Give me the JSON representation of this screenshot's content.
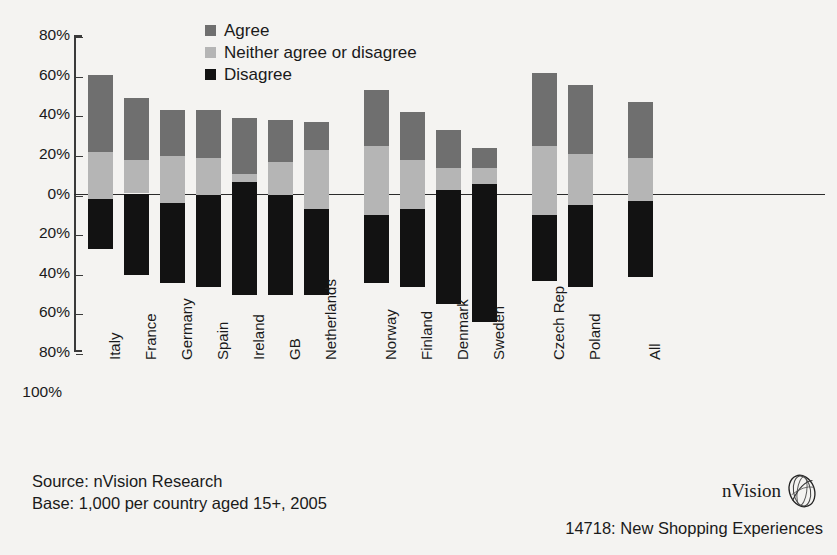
{
  "chart_data": {
    "type": "bar",
    "subtype": "diverging-stacked",
    "title": "",
    "xlabel": "",
    "ylabel": "",
    "ylim": [
      -100,
      80
    ],
    "grid": false,
    "legend_position": "top-center",
    "legend": [
      "Agree",
      "Neither agree or disagree",
      "Disagree"
    ],
    "colors": {
      "agree": "#6f6f6f",
      "neither": "#b5b5b5",
      "disagree": "#121212",
      "zero_line": "#2b2b2b",
      "background": "#f4f3f1"
    },
    "ytick_labels": [
      "80%",
      "60%",
      "40%",
      "20%",
      "0%",
      "20%",
      "40%",
      "60%",
      "80%",
      "100%"
    ],
    "ytick_values": [
      80,
      60,
      40,
      20,
      0,
      -20,
      -40,
      -60,
      -80,
      -100
    ],
    "categories": [
      "Italy",
      "France",
      "Germany",
      "Spain",
      "Ireland",
      "GB",
      "Netherlands",
      "Norway",
      "Finland",
      "Denmark",
      "Sweden",
      "Czech Rep",
      "Poland",
      "All"
    ],
    "series": [
      {
        "name": "Agree",
        "values": [
          60,
          48,
          42,
          42,
          38,
          37,
          36,
          52,
          41,
          32,
          23,
          61,
          55,
          46
        ]
      },
      {
        "name": "Neither agree or disagree",
        "values": [
          21,
          17,
          19,
          18,
          10,
          16,
          22,
          24,
          17,
          13,
          13,
          24,
          20,
          18
        ]
      },
      {
        "name": "Disagree",
        "values": [
          -28,
          -41,
          -45,
          -47,
          -51,
          -51,
          -51,
          -45,
          -47,
          -56,
          -65,
          -44,
          -47,
          -42
        ]
      }
    ],
    "bars": [
      {
        "label": "Italy",
        "agree_top": 60,
        "neither_top": 21,
        "disagree_bottom": -28,
        "neither_bottom": -3
      },
      {
        "label": "France",
        "agree_top": 48,
        "neither_top": 17,
        "disagree_bottom": -41,
        "neither_bottom": 0
      },
      {
        "label": "Germany",
        "agree_top": 42,
        "neither_top": 19,
        "disagree_bottom": -45,
        "neither_bottom": -5
      },
      {
        "label": "Spain",
        "agree_top": 42,
        "neither_top": 18,
        "disagree_bottom": -47,
        "neither_bottom": -1
      },
      {
        "label": "Ireland",
        "agree_top": 38,
        "neither_top": 10,
        "disagree_bottom": -51,
        "neither_bottom": 6
      },
      {
        "label": "GB",
        "agree_top": 37,
        "neither_top": 16,
        "disagree_bottom": -51,
        "neither_bottom": -1
      },
      {
        "label": "Netherlands",
        "agree_top": 36,
        "neither_top": 22,
        "disagree_bottom": -51,
        "neither_bottom": -8
      },
      {
        "label": "Norway",
        "agree_top": 52,
        "neither_top": 24,
        "disagree_bottom": -45,
        "neither_bottom": -11
      },
      {
        "label": "Finland",
        "agree_top": 41,
        "neither_top": 17,
        "disagree_bottom": -47,
        "neither_bottom": -8
      },
      {
        "label": "Denmark",
        "agree_top": 32,
        "neither_top": 13,
        "disagree_bottom": -56,
        "neither_bottom": 2
      },
      {
        "label": "Sweden",
        "agree_top": 23,
        "neither_top": 13,
        "disagree_bottom": -65,
        "neither_bottom": 5
      },
      {
        "label": "Czech Rep",
        "agree_top": 61,
        "neither_top": 24,
        "disagree_bottom": -44,
        "neither_bottom": -11
      },
      {
        "label": "Poland",
        "agree_top": 55,
        "neither_top": 20,
        "disagree_bottom": -47,
        "neither_bottom": -6
      },
      {
        "label": "All",
        "agree_top": 46,
        "neither_top": 18,
        "disagree_bottom": -42,
        "neither_bottom": -4
      }
    ]
  },
  "legend": {
    "items": [
      {
        "label": "Agree",
        "color": "#6f6f6f"
      },
      {
        "label": "Neither agree or disagree",
        "color": "#b5b5b5"
      },
      {
        "label": "Disagree",
        "color": "#121212"
      }
    ]
  },
  "footer": {
    "source_line_1": "Source: nVision Research",
    "source_line_2": "Base: 1,000 per country aged 15+, 2005",
    "slide_ref": "14718: New Shopping Experiences",
    "brand_name": "nVision"
  }
}
